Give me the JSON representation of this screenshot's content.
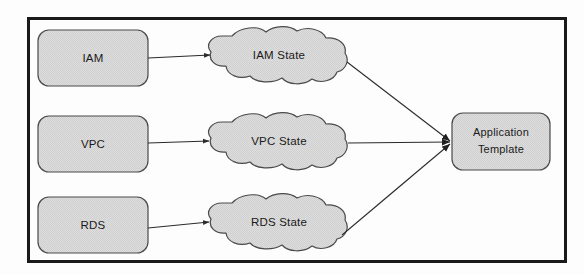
{
  "figure": {
    "kind": "architecture-flow-diagram",
    "frame": {
      "border_color": "#1a1a1a",
      "background": "#fdfdfd"
    },
    "style": {
      "shape_fill": "#d9d9d9",
      "shape_stroke": "#4a4a4a",
      "arrow_color": "#2b2b2b",
      "text_color": "#1a1a1a"
    }
  },
  "sources": [
    {
      "id": "iam",
      "label": "IAM"
    },
    {
      "id": "vpc",
      "label": "VPC"
    },
    {
      "id": "rds",
      "label": "RDS"
    }
  ],
  "states": [
    {
      "id": "iam-state",
      "label": "IAM State"
    },
    {
      "id": "vpc-state",
      "label": "VPC State"
    },
    {
      "id": "rds-state",
      "label": "RDS State"
    }
  ],
  "target": {
    "id": "application-template",
    "label_line1": "Application",
    "label_line2": "Template"
  },
  "edges": [
    {
      "from": "iam",
      "to": "iam-state"
    },
    {
      "from": "vpc",
      "to": "vpc-state"
    },
    {
      "from": "rds",
      "to": "rds-state"
    },
    {
      "from": "iam-state",
      "to": "application-template"
    },
    {
      "from": "vpc-state",
      "to": "application-template"
    },
    {
      "from": "rds-state",
      "to": "application-template"
    }
  ]
}
